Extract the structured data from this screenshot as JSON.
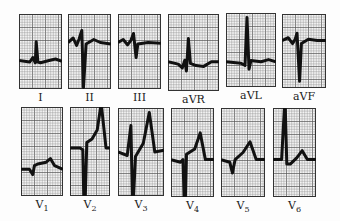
{
  "figure": {
    "grid_color": "#8a8a8a",
    "grid_major_color": "#555555",
    "trace_color": "#111111",
    "paper_color": "#f4f4f4"
  },
  "rows": [
    {
      "name": "limb-leads",
      "leads": [
        {
          "id": "I",
          "label": "I",
          "sub": "",
          "x": 19,
          "y": 14,
          "w": 43,
          "h": 75,
          "baseline": 0.62,
          "trace": [
            [
              0,
              0
            ],
            [
              0.25,
              0.02
            ],
            [
              0.32,
              -0.04
            ],
            [
              0.38,
              0.03
            ],
            [
              0.4,
              -0.25
            ],
            [
              0.44,
              0.02
            ],
            [
              0.5,
              0.03
            ],
            [
              0.7,
              0.0
            ],
            [
              0.85,
              -0.02
            ],
            [
              1,
              0.01
            ]
          ]
        },
        {
          "id": "II",
          "label": "II",
          "sub": "",
          "x": 68,
          "y": 14,
          "w": 43,
          "h": 75,
          "baseline": 0.38,
          "trace": [
            [
              0,
              0
            ],
            [
              0.12,
              -0.06
            ],
            [
              0.2,
              0.04
            ],
            [
              0.26,
              -0.05
            ],
            [
              0.32,
              -0.16
            ],
            [
              0.36,
              0.6
            ],
            [
              0.42,
              0.02
            ],
            [
              0.6,
              -0.04
            ],
            [
              0.75,
              0.0
            ],
            [
              1,
              0.02
            ]
          ]
        },
        {
          "id": "III",
          "label": "III",
          "sub": "",
          "x": 118,
          "y": 14,
          "w": 43,
          "h": 75,
          "baseline": 0.38,
          "trace": [
            [
              0,
              0
            ],
            [
              0.12,
              -0.04
            ],
            [
              0.22,
              0.03
            ],
            [
              0.3,
              -0.03
            ],
            [
              0.36,
              -0.12
            ],
            [
              0.42,
              0.2
            ],
            [
              0.46,
              0.02
            ],
            [
              0.7,
              0.0
            ],
            [
              1,
              0.01
            ]
          ]
        },
        {
          "id": "aVR",
          "label": "aVR",
          "sub": "",
          "x": 168,
          "y": 14,
          "w": 51,
          "h": 77,
          "baseline": 0.62,
          "trace": [
            [
              0,
              0
            ],
            [
              0.2,
              0.03
            ],
            [
              0.28,
              0.08
            ],
            [
              0.33,
              -0.02
            ],
            [
              0.36,
              0.12
            ],
            [
              0.4,
              -0.3
            ],
            [
              0.44,
              0.02
            ],
            [
              0.55,
              0.05
            ],
            [
              0.7,
              0.06
            ],
            [
              0.85,
              0.0
            ],
            [
              1,
              0.0
            ]
          ]
        },
        {
          "id": "aVL",
          "label": "aVL",
          "sub": "",
          "x": 226,
          "y": 13,
          "w": 50,
          "h": 74,
          "baseline": 0.66,
          "trace": [
            [
              0,
              0
            ],
            [
              0.3,
              0.02
            ],
            [
              0.38,
              0.05
            ],
            [
              0.42,
              -0.6
            ],
            [
              0.46,
              0.1
            ],
            [
              0.5,
              -0.02
            ],
            [
              0.7,
              0.0
            ],
            [
              0.85,
              -0.03
            ],
            [
              1,
              0.0
            ]
          ]
        },
        {
          "id": "aVF",
          "label": "aVF",
          "sub": "",
          "x": 282,
          "y": 14,
          "w": 44,
          "h": 74,
          "baseline": 0.36,
          "trace": [
            [
              0,
              0
            ],
            [
              0.14,
              -0.04
            ],
            [
              0.24,
              0.04
            ],
            [
              0.3,
              -0.02
            ],
            [
              0.34,
              -0.1
            ],
            [
              0.4,
              0.55
            ],
            [
              0.44,
              0.04
            ],
            [
              0.6,
              -0.02
            ],
            [
              0.8,
              0.0
            ],
            [
              1,
              0.0
            ]
          ]
        }
      ]
    },
    {
      "name": "precordial-leads",
      "leads": [
        {
          "id": "V1",
          "label": "V",
          "sub": "1",
          "x": 21,
          "y": 107,
          "w": 42,
          "h": 89,
          "baseline": 0.7,
          "trace": [
            [
              0,
              0
            ],
            [
              0.2,
              0.0
            ],
            [
              0.28,
              0.06
            ],
            [
              0.32,
              -0.04
            ],
            [
              0.4,
              -0.06
            ],
            [
              0.6,
              -0.08
            ],
            [
              0.7,
              -0.12
            ],
            [
              0.8,
              -0.04
            ],
            [
              1,
              0.0
            ]
          ]
        },
        {
          "id": "V2",
          "label": "V",
          "sub": "2",
          "x": 70,
          "y": 107,
          "w": 40,
          "h": 89,
          "baseline": 0.46,
          "trace": [
            [
              0,
              0
            ],
            [
              0.25,
              0.0
            ],
            [
              0.32,
              0.02
            ],
            [
              0.36,
              0.9
            ],
            [
              0.42,
              -0.06
            ],
            [
              0.55,
              -0.1
            ],
            [
              0.68,
              -0.2
            ],
            [
              0.78,
              -0.5
            ],
            [
              0.9,
              0.0
            ],
            [
              1,
              0.0
            ]
          ]
        },
        {
          "id": "V3",
          "label": "V",
          "sub": "3",
          "x": 118,
          "y": 108,
          "w": 46,
          "h": 88,
          "baseline": 0.5,
          "trace": [
            [
              0,
              0
            ],
            [
              0.2,
              0.04
            ],
            [
              0.28,
              -0.3
            ],
            [
              0.32,
              0.7
            ],
            [
              0.38,
              0.05
            ],
            [
              0.55,
              -0.1
            ],
            [
              0.68,
              -0.45
            ],
            [
              0.8,
              0.0
            ],
            [
              1,
              -0.02
            ]
          ]
        },
        {
          "id": "V4",
          "label": "V",
          "sub": "4",
          "x": 171,
          "y": 108,
          "w": 43,
          "h": 89,
          "baseline": 0.58,
          "trace": [
            [
              0,
              0
            ],
            [
              0.22,
              0.03
            ],
            [
              0.28,
              0.0
            ],
            [
              0.32,
              0.7
            ],
            [
              0.36,
              -0.06
            ],
            [
              0.55,
              -0.12
            ],
            [
              0.68,
              -0.3
            ],
            [
              0.8,
              0.0
            ],
            [
              1,
              0.0
            ]
          ]
        },
        {
          "id": "V5",
          "label": "V",
          "sub": "5",
          "x": 221,
          "y": 108,
          "w": 44,
          "h": 89,
          "baseline": 0.58,
          "trace": [
            [
              0,
              0
            ],
            [
              0.2,
              0.03
            ],
            [
              0.26,
              0.15
            ],
            [
              0.32,
              0.0
            ],
            [
              0.5,
              -0.08
            ],
            [
              0.66,
              -0.2
            ],
            [
              0.8,
              0.0
            ],
            [
              1,
              0.0
            ]
          ]
        },
        {
          "id": "V6",
          "label": "V",
          "sub": "6",
          "x": 273,
          "y": 108,
          "w": 43,
          "h": 89,
          "baseline": 0.58,
          "trace": [
            [
              0,
              0
            ],
            [
              0.2,
              0.0
            ],
            [
              0.28,
              -0.7
            ],
            [
              0.32,
              0.05
            ],
            [
              0.4,
              0.05
            ],
            [
              0.55,
              -0.02
            ],
            [
              0.68,
              -0.1
            ],
            [
              0.8,
              0.0
            ],
            [
              1,
              0.0
            ]
          ]
        }
      ]
    }
  ]
}
